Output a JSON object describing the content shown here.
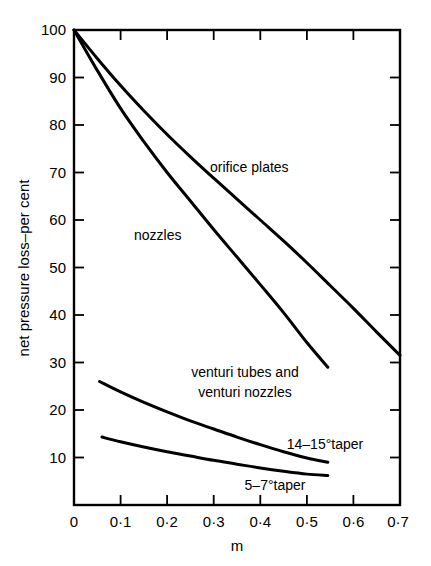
{
  "chart_data": {
    "type": "line",
    "title": "",
    "xlabel": "m",
    "ylabel": "net pressure loss–per cent",
    "xlim": [
      0,
      0.7
    ],
    "ylim": [
      0,
      100
    ],
    "grid": false,
    "legend_position": "inline-annotations",
    "x_tick_labels": [
      "0",
      "0·1",
      "0·2",
      "0·3",
      "0·4",
      "0·5",
      "0·6",
      "0·7"
    ],
    "x_tick_values": [
      0,
      0.1,
      0.2,
      0.3,
      0.4,
      0.5,
      0.6,
      0.7
    ],
    "y_tick_labels": [
      "10",
      "20",
      "30",
      "40",
      "50",
      "60",
      "70",
      "80",
      "90",
      "100"
    ],
    "y_tick_values": [
      10,
      20,
      30,
      40,
      50,
      60,
      70,
      80,
      90,
      100
    ],
    "series": [
      {
        "name": "orifice plates",
        "label": "orifice plates",
        "x": [
          0.0,
          0.05,
          0.1,
          0.15,
          0.2,
          0.25,
          0.3,
          0.35,
          0.4,
          0.45,
          0.5,
          0.55,
          0.6,
          0.65,
          0.7
        ],
        "values": [
          100.0,
          94.0,
          88.3,
          83.0,
          78.0,
          73.3,
          68.8,
          64.4,
          60.0,
          55.6,
          51.0,
          46.2,
          41.4,
          36.4,
          31.5
        ]
      },
      {
        "name": "nozzles",
        "label": "nozzles",
        "x": [
          0.0,
          0.05,
          0.1,
          0.15,
          0.2,
          0.25,
          0.3,
          0.35,
          0.4,
          0.45,
          0.5,
          0.545
        ],
        "values": [
          100.0,
          91.5,
          83.5,
          76.5,
          70.0,
          64.0,
          58.0,
          52.2,
          46.4,
          40.5,
          34.2,
          29.0
        ]
      },
      {
        "name": "venturi-14-15-taper",
        "label": "14–15°taper",
        "x": [
          0.055,
          0.1,
          0.15,
          0.2,
          0.25,
          0.3,
          0.35,
          0.4,
          0.45,
          0.5,
          0.545
        ],
        "values": [
          26.0,
          23.8,
          21.6,
          19.6,
          17.7,
          16.0,
          14.3,
          12.7,
          11.2,
          9.9,
          9.0
        ]
      },
      {
        "name": "venturi-5-7-taper",
        "label": "5–7°taper",
        "x": [
          0.06,
          0.1,
          0.15,
          0.2,
          0.25,
          0.3,
          0.35,
          0.4,
          0.45,
          0.5,
          0.545
        ],
        "values": [
          14.3,
          13.3,
          12.2,
          11.2,
          10.3,
          9.4,
          8.6,
          7.8,
          7.1,
          6.5,
          6.2
        ]
      }
    ],
    "annotations": [
      {
        "name": "orifice-plates-label",
        "text": "orifice plates",
        "x": 0.33,
        "y": 71.5
      },
      {
        "name": "nozzles-label",
        "text": "nozzles",
        "x": 0.13,
        "y": 57.0
      },
      {
        "name": "venturi-group-label-line1",
        "text": "venturi tubes and",
        "x": 0.29,
        "y": 22.8
      },
      {
        "name": "venturi-group-label-line2",
        "text": "venturi nozzles",
        "x": 0.29,
        "y": 19.8
      },
      {
        "name": "taper-14-15-label",
        "text": "14–15°taper",
        "x": 0.53,
        "y": 11.7
      },
      {
        "name": "taper-5-7-label",
        "text": "5–7°taper",
        "x": 0.43,
        "y": 4.0
      }
    ],
    "colors": {
      "curve": "#000000",
      "axis": "#000000",
      "background": "#ffffff"
    }
  }
}
